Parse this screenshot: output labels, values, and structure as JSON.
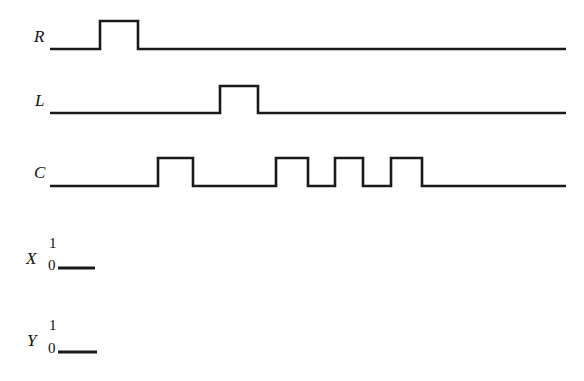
{
  "figure": {
    "type": "timing-diagram",
    "background_color": "#ffffff",
    "line_color": "#1a1a1a",
    "line_width": 2.6,
    "width": 584,
    "height": 381
  },
  "signals": [
    {
      "name": "R",
      "label": "R",
      "baseline_y": 49,
      "high_y": 21,
      "x_start": 50,
      "x_end": 566,
      "pulses": [
        {
          "rise": 100,
          "fall": 138
        }
      ]
    },
    {
      "name": "L",
      "label": "L",
      "baseline_y": 113,
      "high_y": 86,
      "x_start": 50,
      "x_end": 566,
      "pulses": [
        {
          "rise": 220,
          "fall": 258
        }
      ]
    },
    {
      "name": "C",
      "label": "C",
      "baseline_y": 186,
      "high_y": 158,
      "x_start": 50,
      "x_end": 566,
      "pulses": [
        {
          "rise": 158,
          "fall": 193
        },
        {
          "rise": 276,
          "fall": 308
        },
        {
          "rise": 335,
          "fall": 363
        },
        {
          "rise": 391,
          "fall": 422
        }
      ]
    }
  ],
  "level_signals": [
    {
      "name": "X",
      "label": "X",
      "high_label": "1",
      "low_label": "0",
      "stub_y": 268,
      "stub_x_start": 58,
      "stub_x_end": 95
    },
    {
      "name": "Y",
      "label": "Y",
      "high_label": "1",
      "low_label": "0",
      "stub_y": 352,
      "stub_x_start": 58,
      "stub_x_end": 97
    }
  ],
  "chart_data": {
    "type": "line",
    "title": "",
    "xlabel": "",
    "ylabel": "",
    "series": [
      {
        "name": "R",
        "points": [
          [
            50,
            0
          ],
          [
            100,
            0
          ],
          [
            100,
            1
          ],
          [
            138,
            1
          ],
          [
            138,
            0
          ],
          [
            566,
            0
          ]
        ]
      },
      {
        "name": "L",
        "points": [
          [
            50,
            0
          ],
          [
            220,
            0
          ],
          [
            220,
            1
          ],
          [
            258,
            1
          ],
          [
            258,
            0
          ],
          [
            566,
            0
          ]
        ]
      },
      {
        "name": "C",
        "points": [
          [
            50,
            0
          ],
          [
            158,
            0
          ],
          [
            158,
            1
          ],
          [
            193,
            1
          ],
          [
            193,
            0
          ],
          [
            276,
            0
          ],
          [
            276,
            1
          ],
          [
            308,
            1
          ],
          [
            308,
            0
          ],
          [
            335,
            0
          ],
          [
            335,
            1
          ],
          [
            363,
            1
          ],
          [
            363,
            0
          ],
          [
            391,
            0
          ],
          [
            391,
            1
          ],
          [
            422,
            1
          ],
          [
            422,
            0
          ],
          [
            566,
            0
          ]
        ]
      },
      {
        "name": "X",
        "points": [
          [
            58,
            0
          ],
          [
            95,
            0
          ]
        ]
      },
      {
        "name": "Y",
        "points": [
          [
            58,
            0
          ],
          [
            97,
            0
          ]
        ]
      }
    ],
    "ylim": [
      0,
      1
    ],
    "ytick_labels": [
      "0",
      "1"
    ],
    "legend": "none",
    "grid": false
  }
}
